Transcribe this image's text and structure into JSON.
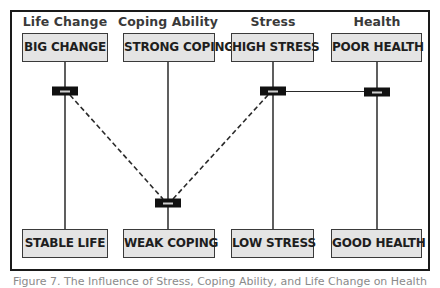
{
  "diagram": {
    "columns": [
      {
        "label": "Life Change",
        "top": "BIG CHANGE",
        "bottom": "STABLE LIFE",
        "x": 65
      },
      {
        "label": "Coping Ability",
        "top": "STRONG COPING",
        "bottom": "WEAK COPING",
        "x": 168
      },
      {
        "label": "Stress",
        "top": "HIGH STRESS",
        "bottom": "LOW STRESS",
        "x": 273
      },
      {
        "label": "Health",
        "top": "POOR HEALTH",
        "bottom": "GOOD HEALTH",
        "x": 377
      }
    ],
    "markers": [
      {
        "column": "Life Change",
        "position": "near-top",
        "y": 91
      },
      {
        "column": "Coping Ability",
        "position": "near-bottom",
        "y": 203
      },
      {
        "column": "Stress",
        "position": "near-top",
        "y": 91
      },
      {
        "column": "Health",
        "position": "near-top",
        "y": 92
      }
    ],
    "connections": [
      {
        "from": "Life Change",
        "to": "Coping Ability",
        "style": "dashed"
      },
      {
        "from": "Coping Ability",
        "to": "Stress",
        "style": "dashed"
      },
      {
        "from": "Stress",
        "to": "Health",
        "style": "solid"
      }
    ],
    "colors": {
      "box_fill": "#e4e4e4",
      "box_border": "#3a3a3a",
      "line": "#1a1a1a",
      "marker": "#111111"
    }
  },
  "caption": "Figure 7. The Influence of Stress, Coping Ability, and Life Change on Health"
}
